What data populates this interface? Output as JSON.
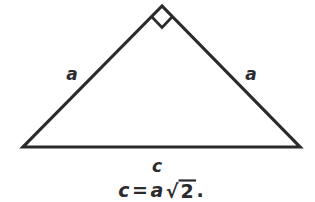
{
  "figure": {
    "name": "isosceles-right-triangle-diagram",
    "background_color": "#ffffff",
    "stroke_color": "#2b2b2e",
    "labels": {
      "left_leg": "a",
      "right_leg": "a",
      "base": "c"
    },
    "right_angle_marker": {
      "present": true,
      "location": "apex",
      "description": "square right-angle marker at top vertex"
    },
    "equation": {
      "lhs": "c",
      "relation": "=",
      "coefficient": "a",
      "radical_symbol": "√",
      "radicand": "2",
      "terminator": ".",
      "full_text": "c = a√2 ."
    },
    "geometry": {
      "apex": [
        162,
        6
      ],
      "left_vertex": [
        23,
        147
      ],
      "right_vertex": [
        300,
        147
      ]
    }
  }
}
